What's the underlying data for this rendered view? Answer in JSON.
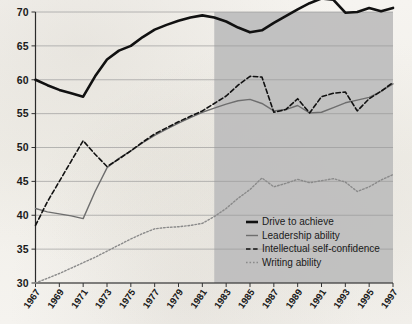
{
  "chart_data": {
    "type": "line",
    "title": "",
    "subtitle": "",
    "xlabel": "",
    "ylabel": "",
    "xlim": [
      1967,
      1997
    ],
    "ylim": [
      30,
      70
    ],
    "yticks": [
      30,
      35,
      40,
      45,
      50,
      55,
      60,
      65,
      70
    ],
    "grid": true,
    "legend_position": "inside-bottom-right",
    "shaded_region": {
      "from": 1982,
      "to": 1997,
      "color": "#bdbdbd",
      "label": ""
    },
    "x": [
      1967,
      1968,
      1969,
      1970,
      1971,
      1972,
      1973,
      1974,
      1975,
      1976,
      1977,
      1978,
      1979,
      1980,
      1981,
      1982,
      1983,
      1984,
      1985,
      1986,
      1987,
      1988,
      1989,
      1990,
      1991,
      1992,
      1993,
      1994,
      1995,
      1996,
      1997
    ],
    "xtick_labels": [
      "1967",
      "1969",
      "1971",
      "1973",
      "1975",
      "1977",
      "1979",
      "1981",
      "1983",
      "1985",
      "1987",
      "1989",
      "1991",
      "1993",
      "1995",
      "1997"
    ],
    "series": [
      {
        "name": "Drive to achieve",
        "style": "solid-thick",
        "color": "#111111",
        "values": [
          60.0,
          59.2,
          58.5,
          58.0,
          57.5,
          60.5,
          63.0,
          64.3,
          65.0,
          66.3,
          67.4,
          68.1,
          68.7,
          69.2,
          69.5,
          69.2,
          68.6,
          67.7,
          67.0,
          67.3,
          68.4,
          69.4,
          70.4,
          71.3,
          72.0,
          71.8,
          69.9,
          70.0,
          70.6,
          70.1,
          70.6
        ]
      },
      {
        "name": "Leadership ability",
        "style": "solid-thin",
        "color": "#6e6e6e",
        "values": [
          41.0,
          40.5,
          40.2,
          39.9,
          39.5,
          43.5,
          47.0,
          48.4,
          49.5,
          50.7,
          51.8,
          52.7,
          53.6,
          54.4,
          55.2,
          55.8,
          56.4,
          56.9,
          57.1,
          56.5,
          55.4,
          55.6,
          56.2,
          55.1,
          55.2,
          55.9,
          56.6,
          57.0,
          57.4,
          58.3,
          59.4
        ]
      },
      {
        "name": "Intellectual self-confidence",
        "style": "dashed",
        "color": "#111111",
        "values": [
          38.5,
          42.0,
          45.0,
          48.0,
          51.0,
          49.0,
          47.2,
          48.3,
          49.5,
          50.8,
          52.0,
          52.9,
          53.8,
          54.6,
          55.4,
          56.5,
          57.6,
          59.2,
          60.5,
          60.4,
          55.2,
          55.6,
          57.2,
          55.1,
          57.5,
          58.0,
          58.2,
          55.4,
          57.2,
          58.3,
          59.6
        ]
      },
      {
        "name": "Writing ability",
        "style": "dotted",
        "color": "#8a8a8a",
        "values": [
          30.0,
          30.7,
          31.4,
          32.2,
          33.0,
          33.8,
          34.7,
          35.6,
          36.5,
          37.3,
          38.0,
          38.2,
          38.3,
          38.5,
          38.8,
          39.8,
          41.0,
          42.5,
          43.8,
          45.5,
          44.2,
          44.7,
          45.3,
          44.8,
          45.1,
          45.4,
          44.9,
          43.5,
          44.2,
          45.2,
          46.0
        ]
      }
    ]
  },
  "legend": {
    "items": [
      {
        "label": "Drive to achieve"
      },
      {
        "label": "Leadership ability"
      },
      {
        "label": "Intellectual self-confidence"
      },
      {
        "label": "Writing ability"
      }
    ]
  }
}
